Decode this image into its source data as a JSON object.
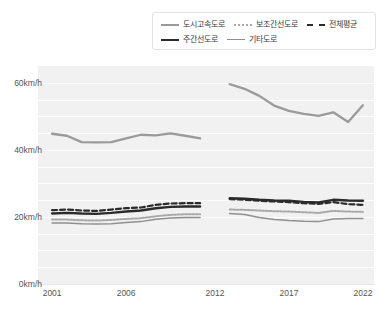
{
  "legend": {
    "items": [
      {
        "label": "도시고속도로",
        "style": "solid-gray",
        "name": "legend-item-urban-expressway"
      },
      {
        "label": "보조간선도로",
        "style": "dotted",
        "name": "legend-item-sub-arterial"
      },
      {
        "label": "전체평균",
        "style": "dashed",
        "name": "legend-item-overall-average"
      },
      {
        "label": "주간선도로",
        "style": "solid-black",
        "name": "legend-item-main-arterial"
      },
      {
        "label": "기타도로",
        "style": "solid-gray2",
        "name": "legend-item-other-road"
      }
    ]
  },
  "axes": {
    "y_ticks": [
      "0km/h",
      "20km/h",
      "40km/h",
      "60km/h"
    ],
    "x_ticks": [
      "2001",
      "2006",
      "2012",
      "2017",
      "2022"
    ]
  },
  "colors": {
    "plot_background": "#f1f1f1",
    "gridline": "#ffffff",
    "urban_expressway": "#9a9a9a",
    "main_arterial": "#2b2b2b",
    "overall_average": "#2b2b2b",
    "sub_arterial": "#a8a8a8",
    "other_road": "#8f8f8f",
    "axis_text": "#555555"
  },
  "chart_data": {
    "type": "line",
    "title": "",
    "xlabel": "",
    "ylabel": "km/h",
    "ylim": [
      0,
      65
    ],
    "yticks": [
      0,
      20,
      40,
      60
    ],
    "xticks": [
      2001,
      2006,
      2012,
      2017,
      2022
    ],
    "grid": true,
    "legend_position": "top-right",
    "note": "Data gap between 2011 and 2013 for all series",
    "x": [
      2001,
      2002,
      2003,
      2004,
      2005,
      2006,
      2007,
      2008,
      2009,
      2010,
      2011,
      2013,
      2014,
      2015,
      2016,
      2017,
      2018,
      2019,
      2020,
      2021,
      2022
    ],
    "series": [
      {
        "name": "도시고속도로",
        "style": "solid",
        "color": "#9a9a9a",
        "values": [
          44.8,
          44.2,
          42.3,
          42.2,
          42.3,
          43.4,
          44.5,
          44.3,
          44.9,
          44.2,
          43.4,
          59.6,
          58.2,
          56.1,
          53.2,
          51.6,
          50.7,
          50.1,
          51.2,
          48.3,
          53.3
        ]
      },
      {
        "name": "전체평균",
        "style": "dashed",
        "color": "#2b2b2b",
        "values": [
          22.0,
          22.2,
          21.9,
          21.8,
          22.2,
          22.6,
          22.8,
          23.6,
          24.0,
          24.1,
          24.1,
          25.3,
          25.1,
          24.8,
          24.6,
          24.4,
          24.1,
          23.9,
          24.4,
          23.8,
          23.6
        ]
      },
      {
        "name": "주간선도로",
        "style": "solid",
        "color": "#2b2b2b",
        "values": [
          21.0,
          21.2,
          21.0,
          20.9,
          21.2,
          21.6,
          21.9,
          22.6,
          23.0,
          23.1,
          23.1,
          25.6,
          25.4,
          25.1,
          24.9,
          24.8,
          24.5,
          24.3,
          25.1,
          24.9,
          24.8
        ]
      },
      {
        "name": "보조간선도로",
        "style": "dotted",
        "color": "#a8a8a8",
        "values": [
          19.2,
          19.2,
          19.0,
          18.9,
          19.1,
          19.4,
          19.6,
          20.2,
          20.6,
          20.8,
          20.8,
          22.2,
          22.1,
          21.9,
          21.7,
          21.6,
          21.4,
          21.2,
          21.8,
          21.6,
          21.5
        ]
      },
      {
        "name": "기타도로",
        "style": "solid",
        "color": "#8f8f8f",
        "values": [
          18.2,
          18.2,
          18.0,
          17.9,
          18.0,
          18.3,
          18.6,
          19.3,
          19.7,
          19.8,
          19.8,
          21.0,
          20.7,
          19.8,
          19.2,
          18.9,
          18.7,
          18.6,
          19.4,
          19.5,
          19.5
        ]
      }
    ]
  }
}
